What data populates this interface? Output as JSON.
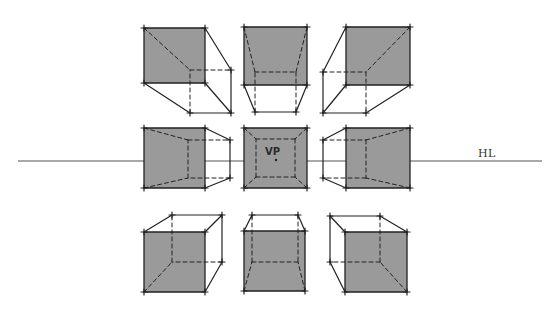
{
  "diagram": {
    "colors": {
      "background": "#ffffff",
      "front_face_fill": "#9a9a9a",
      "line": "#222222",
      "horizon_line": "#555555"
    },
    "horizon_line": {
      "label": "HL",
      "y": 161,
      "x_start": 18,
      "x_end": 542,
      "label_x": 478,
      "label_y": 147
    },
    "vanishing_point": {
      "label": "VP",
      "x": 272,
      "y": 158,
      "label_x": 265,
      "label_y": 146
    },
    "cubes": [
      {
        "id": "top-left",
        "position": "above HL, left of VP",
        "front": [
          [
            144,
            28
          ],
          [
            205,
            28
          ],
          [
            205,
            83
          ],
          [
            144,
            83
          ]
        ],
        "back": [
          [
            190,
            70
          ],
          [
            231,
            70
          ],
          [
            231,
            113
          ],
          [
            190,
            113
          ]
        ],
        "visible_sides": [
          "right",
          "bottom"
        ]
      },
      {
        "id": "top-center",
        "position": "above HL, centered on VP",
        "front": [
          [
            244,
            27
          ],
          [
            307,
            27
          ],
          [
            307,
            85
          ],
          [
            244,
            85
          ]
        ],
        "back": [
          [
            255,
            72
          ],
          [
            296,
            72
          ],
          [
            296,
            112
          ],
          [
            255,
            112
          ]
        ],
        "visible_sides": [
          "bottom"
        ]
      },
      {
        "id": "top-right",
        "position": "above HL, right of VP",
        "front": [
          [
            346,
            27
          ],
          [
            410,
            27
          ],
          [
            410,
            85
          ],
          [
            346,
            85
          ]
        ],
        "back": [
          [
            323,
            72
          ],
          [
            366,
            72
          ],
          [
            366,
            113
          ],
          [
            323,
            113
          ]
        ],
        "visible_sides": [
          "left",
          "bottom"
        ]
      },
      {
        "id": "middle-left",
        "position": "on HL, left of VP",
        "front": [
          [
            144,
            128
          ],
          [
            205,
            128
          ],
          [
            205,
            188
          ],
          [
            144,
            188
          ]
        ],
        "back": [
          [
            188,
            140
          ],
          [
            230,
            140
          ],
          [
            230,
            178
          ],
          [
            188,
            178
          ]
        ],
        "visible_sides": [
          "right"
        ]
      },
      {
        "id": "middle-center",
        "position": "on HL, at VP (viewed head-on)",
        "front": [
          [
            244,
            128
          ],
          [
            307,
            128
          ],
          [
            307,
            188
          ],
          [
            244,
            188
          ]
        ],
        "back": [
          [
            256,
            139
          ],
          [
            295,
            139
          ],
          [
            295,
            177
          ],
          [
            256,
            177
          ]
        ],
        "visible_sides": []
      },
      {
        "id": "middle-right",
        "position": "on HL, right of VP",
        "front": [
          [
            346,
            128
          ],
          [
            410,
            128
          ],
          [
            410,
            188
          ],
          [
            346,
            188
          ]
        ],
        "back": [
          [
            323,
            140
          ],
          [
            366,
            140
          ],
          [
            366,
            178
          ],
          [
            323,
            178
          ]
        ],
        "visible_sides": [
          "left"
        ]
      },
      {
        "id": "bottom-left",
        "position": "below HL, left of VP",
        "front": [
          [
            144,
            232
          ],
          [
            205,
            232
          ],
          [
            205,
            292
          ],
          [
            144,
            292
          ]
        ],
        "back": [
          [
            172,
            215
          ],
          [
            222,
            215
          ],
          [
            222,
            262
          ],
          [
            172,
            262
          ]
        ],
        "visible_sides": [
          "top",
          "right"
        ]
      },
      {
        "id": "bottom-center",
        "position": "below HL, centered on VP",
        "front": [
          [
            244,
            231
          ],
          [
            305,
            231
          ],
          [
            305,
            291
          ],
          [
            244,
            291
          ]
        ],
        "back": [
          [
            252,
            215
          ],
          [
            298,
            215
          ],
          [
            298,
            262
          ],
          [
            252,
            262
          ]
        ],
        "visible_sides": [
          "top"
        ]
      },
      {
        "id": "bottom-right",
        "position": "below HL, right of VP",
        "front": [
          [
            345,
            232
          ],
          [
            407,
            232
          ],
          [
            407,
            292
          ],
          [
            345,
            292
          ]
        ],
        "back": [
          [
            330,
            216
          ],
          [
            380,
            216
          ],
          [
            380,
            262
          ],
          [
            330,
            262
          ]
        ],
        "visible_sides": [
          "top",
          "left"
        ]
      }
    ]
  }
}
